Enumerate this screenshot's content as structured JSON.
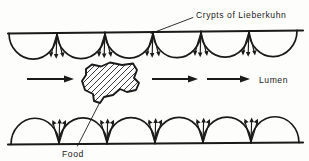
{
  "figure": {
    "title_label": "Crypts of Lieberkuhn",
    "lumen_label": "Lumen",
    "food_label": "Food",
    "ink_color": "#1a1a1a",
    "background_color": "#fdfdfb"
  },
  "labels": {
    "crypts": {
      "text": "Crypts of Lieberkuhn",
      "x": 196,
      "y": 15
    },
    "lumen": {
      "text": "Lumen",
      "x": 258,
      "y": 83
    },
    "food": {
      "text": "Food",
      "x": 80,
      "y": 153
    }
  },
  "diagram": {
    "top_wall": {
      "y_left": 33,
      "y_right": 31,
      "x_start": 8,
      "x_end": 303,
      "arch_count": 6,
      "arch_depth": 26,
      "arrow_cluster_count": 5,
      "orientation": "downward"
    },
    "bottom_wall": {
      "y": 143,
      "x_start": 8,
      "x_end": 303,
      "arch_count": 6,
      "arch_height": 26,
      "arrow_cluster_count": 5,
      "orientation": "upward"
    },
    "flow_arrows": [
      {
        "x1": 27,
        "y1": 79,
        "x2": 73,
        "y2": 79
      },
      {
        "x1": 152,
        "y1": 79,
        "x2": 198,
        "y2": 79
      },
      {
        "x1": 207,
        "y1": 79,
        "x2": 250,
        "y2": 79
      }
    ],
    "food_particle": {
      "center_x": 110,
      "center_y": 85,
      "hatched": true,
      "hatch_angle_deg": 35
    },
    "leader_lines": [
      {
        "name": "crypts-leader",
        "x1": 193,
        "y1": 17,
        "x2": 150,
        "y2": 34
      },
      {
        "name": "food-leader",
        "x1": 99,
        "y1": 104,
        "x2": 77,
        "y2": 145
      }
    ]
  }
}
